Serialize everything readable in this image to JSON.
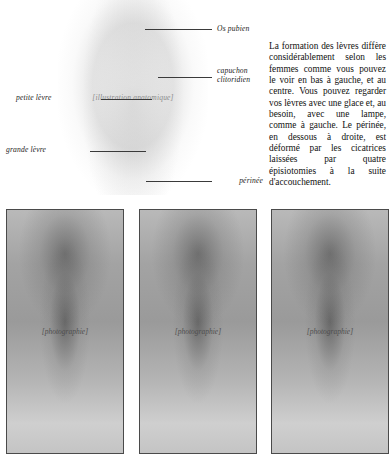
{
  "page": {
    "language": "fr",
    "background_color": "#ffffff"
  },
  "figure": {
    "name": "vulva-anatomy-drawing",
    "media_type": "illustration",
    "placeholder_caption": "[illustration anatomique]",
    "labels": [
      {
        "id": "os-pubien",
        "text": "Os pubien",
        "side": "right",
        "line_from_x": 145,
        "line_to_x": 212,
        "line_y": 29,
        "text_x": 217,
        "text_y": 25
      },
      {
        "id": "capuchon-clitoridien",
        "text_line_1": "capuchon",
        "text_line_2": "clitoridien",
        "side": "right",
        "line_from_x": 158,
        "line_to_x": 212,
        "line_y": 77,
        "text_x": 217,
        "text_y": 67
      },
      {
        "id": "petite-levre",
        "text": "petite lèvre",
        "side": "left",
        "line_from_x": 101,
        "line_to_x": 152,
        "line_y": 99,
        "text_x": 16,
        "text_y": 94
      },
      {
        "id": "grande-levre",
        "text": "grande lèvre",
        "side": "left",
        "line_from_x": 90,
        "line_to_x": 146,
        "line_y": 151,
        "text_x": 6,
        "text_y": 146
      },
      {
        "id": "perinee",
        "text": "périnée",
        "side": "right",
        "line_from_x": 146,
        "line_to_x": 212,
        "line_y": 181,
        "text_x": 217,
        "text_y": 177
      }
    ]
  },
  "body_text": {
    "paragraph": "La formation des lèvres diffère considérablement selon les femmes comme vous pouvez le voir en bas à gauche, et au centre. Vous pouvez regarder vos lèvres avec une glace et, au besoin, avec une lampe, comme à gauche. Le périnée, en dessous à droite, est déformé par les cicatrices laissées par quatre épisiotomies à la suite d'accouchement."
  },
  "panels": [
    {
      "id": "panel-left",
      "position": "gauche",
      "media_type": "photograph",
      "placeholder_caption": "[photographie]"
    },
    {
      "id": "panel-center",
      "position": "centre",
      "media_type": "photograph",
      "placeholder_caption": "[photographie]"
    },
    {
      "id": "panel-right",
      "position": "droite",
      "media_type": "photograph",
      "placeholder_caption": "[photographie]"
    }
  ]
}
